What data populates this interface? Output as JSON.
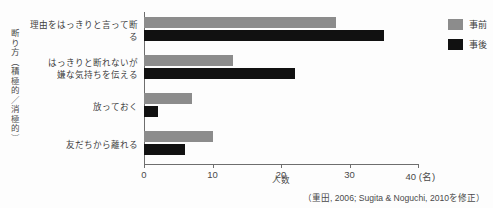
{
  "chart_data": {
    "type": "bar",
    "orientation": "horizontal",
    "title": "",
    "xlabel": "人数",
    "ylabel": "断り方（積極的／消極的）",
    "xlim": [
      0,
      40
    ],
    "xticks": [
      0,
      10,
      20,
      30,
      40
    ],
    "xtick_labels": [
      "0",
      "10",
      "20",
      "30",
      "40 (名)"
    ],
    "xunit": "(名)",
    "grid": false,
    "legend_position": "right-top",
    "categories": [
      "理由をはっきりと言って断る",
      "はっきりと断れないが\n嫌な気持ちを伝える",
      "放っておく",
      "友だちから離れる"
    ],
    "category_lines": [
      [
        "理由をはっきりと言って断る"
      ],
      [
        "はっきりと断れないが",
        "嫌な気持ちを伝える"
      ],
      [
        "放っておく"
      ],
      [
        "友だちから離れる"
      ]
    ],
    "series": [
      {
        "name": "事前",
        "color": "#8c8c8c",
        "values": [
          28,
          13,
          7,
          10
        ]
      },
      {
        "name": "事後",
        "color": "#111111",
        "values": [
          35,
          22,
          2,
          6
        ]
      }
    ],
    "source_note": "（重田, 2006; Sugita & Noguchi, 2010を修正）"
  },
  "legend": {
    "items": [
      {
        "label": "事前",
        "color": "#8c8c8c"
      },
      {
        "label": "事後",
        "color": "#111111"
      }
    ]
  },
  "axis": {
    "y_title": "断り方（積極的／消極的）",
    "x_title": "人数",
    "tick_0": "0",
    "tick_1": "10",
    "tick_2": "20",
    "tick_3": "30",
    "tick_4": "40 (名)"
  },
  "source": {
    "text": "（重田, 2006; Sugita & Noguchi, 2010を修正）"
  }
}
